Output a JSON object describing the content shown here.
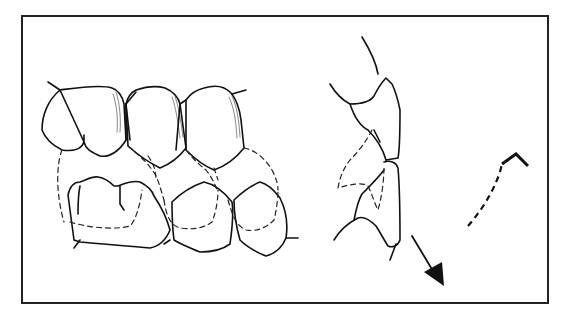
{
  "figure": {
    "panels": [
      {
        "name": "buccal-view",
        "label": ""
      },
      {
        "name": "incisor-profile",
        "label": ""
      },
      {
        "name": "movement-path",
        "label": ""
      }
    ],
    "colors": {
      "line": "#111111",
      "background": "#ffffff",
      "frame": "#222222"
    }
  }
}
